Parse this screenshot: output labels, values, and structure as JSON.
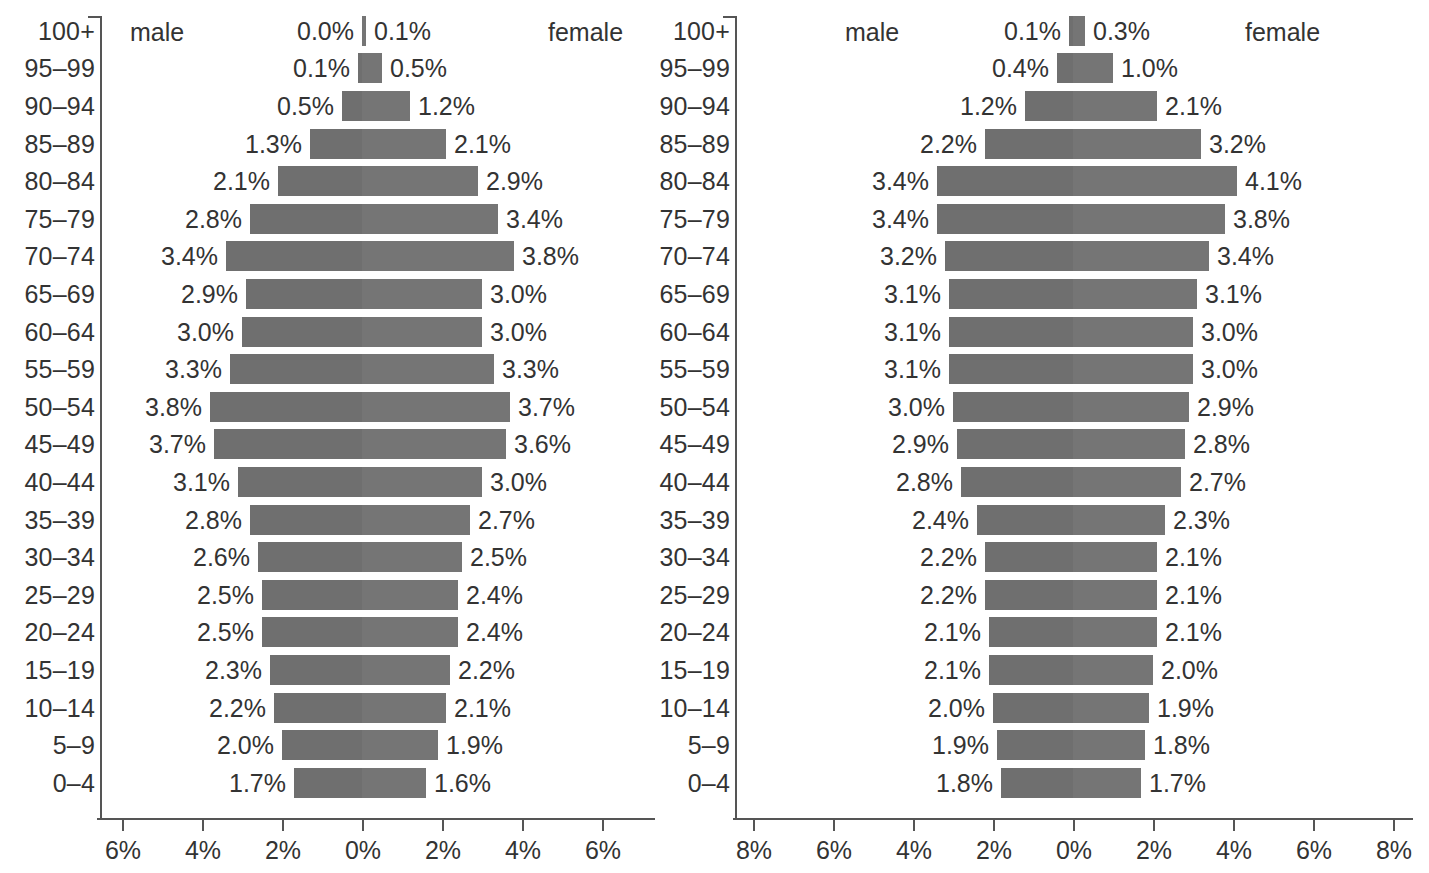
{
  "chart_data": [
    {
      "type": "bar",
      "subtype": "population-pyramid",
      "title": "",
      "panel_id": "left",
      "categories": [
        "100+",
        "95–99",
        "90–94",
        "85–89",
        "80–84",
        "75–79",
        "70–74",
        "65–69",
        "60–64",
        "55–59",
        "50–54",
        "45–49",
        "40–44",
        "35–39",
        "30–34",
        "25–29",
        "20–24",
        "15–19",
        "10–14",
        "5–9",
        "0–4"
      ],
      "series": [
        {
          "name": "male",
          "side": "left",
          "values": [
            0.0,
            0.1,
            0.5,
            1.3,
            2.1,
            2.8,
            3.4,
            2.9,
            3.0,
            3.3,
            3.8,
            3.7,
            3.1,
            2.8,
            2.6,
            2.5,
            2.5,
            2.3,
            2.2,
            2.0,
            1.7
          ],
          "labels": [
            "0.0%",
            "0.1%",
            "0.5%",
            "1.3%",
            "2.1%",
            "2.8%",
            "3.4%",
            "2.9%",
            "3.0%",
            "3.3%",
            "3.8%",
            "3.7%",
            "3.1%",
            "2.8%",
            "2.6%",
            "2.5%",
            "2.5%",
            "2.3%",
            "2.2%",
            "2.0%",
            "1.7%"
          ]
        },
        {
          "name": "female",
          "side": "right",
          "values": [
            0.1,
            0.5,
            1.2,
            2.1,
            2.9,
            3.4,
            3.8,
            3.0,
            3.0,
            3.3,
            3.7,
            3.6,
            3.0,
            2.7,
            2.5,
            2.4,
            2.4,
            2.2,
            2.1,
            1.9,
            1.6
          ],
          "labels": [
            "0.1%",
            "0.5%",
            "1.2%",
            "2.1%",
            "2.9%",
            "3.4%",
            "3.8%",
            "3.0%",
            "3.0%",
            "3.3%",
            "3.7%",
            "3.6%",
            "3.0%",
            "2.7%",
            "2.5%",
            "2.4%",
            "2.4%",
            "2.2%",
            "2.1%",
            "1.9%",
            "1.6%"
          ]
        }
      ],
      "xlabel": "",
      "ylabel": "",
      "xlim": [
        -6,
        6
      ],
      "xticks": [
        -6,
        -4,
        -2,
        0,
        2,
        4,
        6
      ],
      "xticklabels": [
        "6%",
        "4%",
        "2%",
        "0%",
        "2%",
        "4%",
        "6%"
      ],
      "grid": false,
      "legend": [
        "male",
        "female"
      ],
      "legend_position": "top-inline"
    },
    {
      "type": "bar",
      "subtype": "population-pyramid",
      "title": "",
      "panel_id": "right",
      "categories": [
        "100+",
        "95–99",
        "90–94",
        "85–89",
        "80–84",
        "75–79",
        "70–74",
        "65–69",
        "60–64",
        "55–59",
        "50–54",
        "45–49",
        "40–44",
        "35–39",
        "30–34",
        "25–29",
        "20–24",
        "15–19",
        "10–14",
        "5–9",
        "0–4"
      ],
      "series": [
        {
          "name": "male",
          "side": "left",
          "values": [
            0.1,
            0.4,
            1.2,
            2.2,
            3.4,
            3.4,
            3.2,
            3.1,
            3.1,
            3.1,
            3.0,
            2.9,
            2.8,
            2.4,
            2.2,
            2.2,
            2.1,
            2.1,
            2.0,
            1.9,
            1.8
          ],
          "labels": [
            "0.1%",
            "0.4%",
            "1.2%",
            "2.2%",
            "3.4%",
            "3.4%",
            "3.2%",
            "3.1%",
            "3.1%",
            "3.1%",
            "3.0%",
            "2.9%",
            "2.8%",
            "2.4%",
            "2.2%",
            "2.2%",
            "2.1%",
            "2.1%",
            "2.0%",
            "1.9%",
            "1.8%"
          ]
        },
        {
          "name": "female",
          "side": "right",
          "values": [
            0.3,
            1.0,
            2.1,
            3.2,
            4.1,
            3.8,
            3.4,
            3.1,
            3.0,
            3.0,
            2.9,
            2.8,
            2.7,
            2.3,
            2.1,
            2.1,
            2.1,
            2.0,
            1.9,
            1.8,
            1.7
          ],
          "labels": [
            "0.3%",
            "1.0%",
            "2.1%",
            "3.2%",
            "4.1%",
            "3.8%",
            "3.4%",
            "3.1%",
            "3.0%",
            "3.0%",
            "2.9%",
            "2.8%",
            "2.7%",
            "2.3%",
            "2.1%",
            "2.1%",
            "2.1%",
            "2.0%",
            "1.9%",
            "1.8%",
            "1.7%"
          ]
        }
      ],
      "xlabel": "",
      "ylabel": "",
      "xlim": [
        -8,
        8
      ],
      "xticks": [
        -8,
        -6,
        -4,
        -2,
        0,
        2,
        4,
        6,
        8
      ],
      "xticklabels": [
        "8%",
        "6%",
        "4%",
        "2%",
        "0%",
        "2%",
        "4%",
        "6%",
        "8%"
      ],
      "grid": false,
      "legend": [
        "male",
        "female"
      ],
      "legend_position": "top-inline"
    }
  ],
  "panels": {
    "left": {
      "male_caption": "male",
      "female_caption": "female"
    },
    "right": {
      "male_caption": "male",
      "female_caption": "female"
    }
  },
  "style": {
    "bar_color": "#6f6f6f",
    "bar_color_female": "#757575",
    "text_color": "#333333",
    "axis_color": "#555555",
    "background": "#ffffff"
  }
}
